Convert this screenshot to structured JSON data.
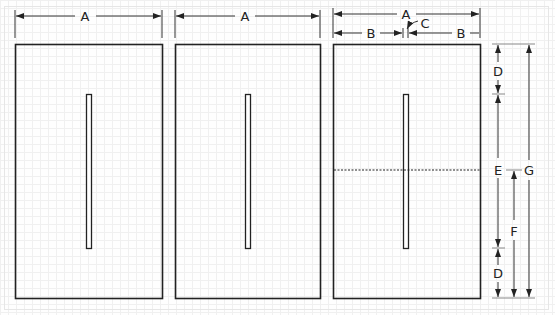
{
  "diagram": {
    "title": "",
    "panels": [
      {
        "id": "panel-1",
        "width_label": "A",
        "has_center_slot": true,
        "has_midline": false
      },
      {
        "id": "panel-2",
        "width_label": "A",
        "has_center_slot": true,
        "has_midline": false
      },
      {
        "id": "panel-3",
        "width_label": "A",
        "has_center_slot": true,
        "has_midline": true
      }
    ],
    "dimensions": {
      "overall_width": "A",
      "half_width": "B",
      "slot_width": "C",
      "end_margin": "D",
      "slot_length": "E",
      "midline_height": "F",
      "overall_height": "G"
    },
    "labels": {
      "a1": "A",
      "a2": "A",
      "a3": "A",
      "b_left": "B",
      "b_right": "B",
      "c": "C",
      "d_top": "D",
      "d_bottom": "D",
      "e": "E",
      "f": "F",
      "g": "G"
    },
    "colors": {
      "stroke": "#222222",
      "dim_line": "#333333",
      "grid": "#f0f0f0",
      "background": "#fefefe"
    }
  }
}
